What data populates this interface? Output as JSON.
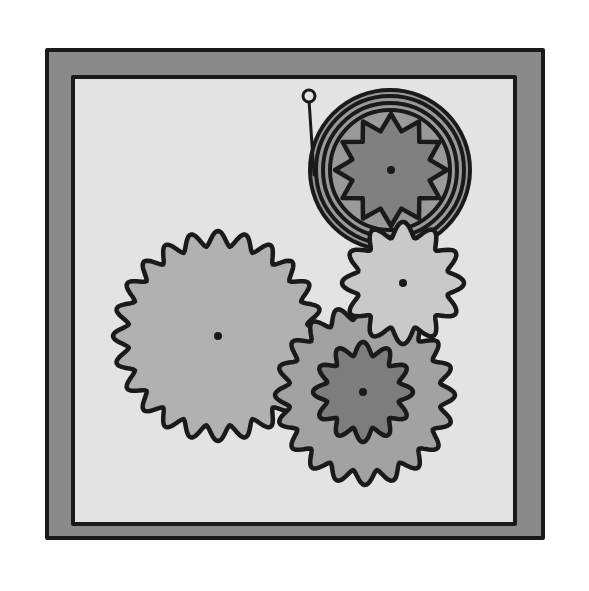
{
  "illustration": {
    "title": "Gears in a frame",
    "canvas": {
      "width": 589,
      "height": 591,
      "background": "#ffffff"
    },
    "frame": {
      "outer": {
        "x": 47,
        "y": 50,
        "w": 496,
        "h": 488
      },
      "inner": {
        "x": 73,
        "y": 77,
        "w": 442,
        "h": 447
      },
      "border_color": "#8a8a8a",
      "panel_color": "#e3e3e3",
      "stroke_color": "#1a1a1a"
    },
    "gears": [
      {
        "id": "gear-large-left",
        "cx": 218,
        "cy": 336,
        "r_outer": 105,
        "r_inner": 90,
        "teeth": 24,
        "fill": "#b1b1b1",
        "phase": 0
      },
      {
        "id": "gear-medium-bottom",
        "cx": 365,
        "cy": 395,
        "r_outer": 90,
        "r_inner": 76,
        "teeth": 20,
        "fill": "#a2a2a2",
        "phase": 0.1
      },
      {
        "id": "gear-small-center-bottom",
        "cx": 363,
        "cy": 392,
        "r_outer": 50,
        "r_inner": 37,
        "teeth": 12,
        "fill": "#7d7d7d",
        "phase": 0.2
      },
      {
        "id": "gear-small-right",
        "cx": 403,
        "cy": 283,
        "r_outer": 61,
        "r_inner": 46,
        "teeth": 12,
        "fill": "#c9c9c9",
        "phase": 0.05
      },
      {
        "id": "gear-top-right-star",
        "cx": 391,
        "cy": 170,
        "r_outer": 56,
        "r_inner": 40,
        "teeth": 12,
        "fill": "#808080",
        "phase": 0,
        "pointed": true
      }
    ],
    "spiral": {
      "cx": 390,
      "cy": 170,
      "radii": [
        60,
        67,
        74,
        80
      ],
      "fill": "#9a9a9a",
      "tail": {
        "x1": 309,
        "y1": 100,
        "x2": 314,
        "y2": 175
      },
      "knob": {
        "cx": 309,
        "cy": 96,
        "r": 6
      }
    }
  }
}
